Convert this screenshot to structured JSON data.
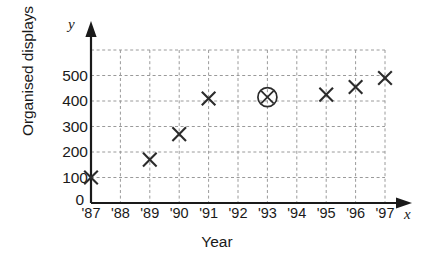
{
  "chart_data": {
    "type": "scatter",
    "title": "",
    "xlabel": "Year",
    "ylabel": "Organised displays",
    "x_axis_letter": "y",
    "y_axis_letter": "x",
    "axis_letters": {
      "vertical": "y",
      "horizontal": "x"
    },
    "categories": [
      "'87",
      "'88",
      "'89",
      "'90",
      "'91",
      "'92",
      "'93",
      "'94",
      "'95",
      "'96",
      "'97"
    ],
    "x_tick_labels": [
      "'87",
      "'88",
      "'89",
      "'90",
      "'91",
      "'92",
      "'93",
      "'94",
      "'95",
      "'96",
      "'97"
    ],
    "y_tick_labels": [
      "0",
      "100",
      "200",
      "300",
      "400",
      "500"
    ],
    "y_ticks": [
      0,
      100,
      200,
      300,
      400,
      500
    ],
    "ylim": [
      0,
      600
    ],
    "xlim": [
      "'87",
      "'97"
    ],
    "grid": true,
    "grid_style": "dashed",
    "legend": "none",
    "points": [
      {
        "x": "'87",
        "y": 100,
        "marker": "cross",
        "highlighted": false
      },
      {
        "x": "'89",
        "y": 170,
        "marker": "cross",
        "highlighted": false
      },
      {
        "x": "'90",
        "y": 270,
        "marker": "cross",
        "highlighted": false
      },
      {
        "x": "'91",
        "y": 410,
        "marker": "cross",
        "highlighted": false
      },
      {
        "x": "'93",
        "y": 415,
        "marker": "cross",
        "highlighted": true
      },
      {
        "x": "'95",
        "y": 425,
        "marker": "cross",
        "highlighted": false
      },
      {
        "x": "'96",
        "y": 455,
        "marker": "cross",
        "highlighted": false
      },
      {
        "x": "'97",
        "y": 490,
        "marker": "cross",
        "highlighted": false
      }
    ],
    "colors": {
      "axis": "#1a1a1a",
      "grid": "#9a9a9a",
      "marker": "#2b2b2b",
      "background": "#ffffff"
    }
  }
}
